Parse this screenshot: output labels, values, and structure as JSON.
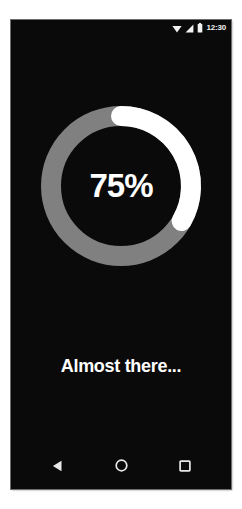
{
  "device": {
    "screen_background": "#0a0a0a"
  },
  "status_bar": {
    "time": "12:30",
    "icons": [
      {
        "name": "wifi-icon",
        "glyph": "wifi"
      },
      {
        "name": "cellular-signal-icon",
        "glyph": "signal"
      },
      {
        "name": "battery-icon",
        "glyph": "battery"
      }
    ],
    "icon_color": "#f2f2f2"
  },
  "progress": {
    "percent_label": "75%",
    "percent_value": 75,
    "arc_sweep_degrees": 120,
    "arc_start_degrees": 0,
    "track_color": "#808080",
    "indicator_color": "#ffffff",
    "stroke_width": 20
  },
  "message": {
    "text": "Almost there...",
    "color": "#ffffff"
  },
  "nav_bar": {
    "buttons": [
      {
        "name": "back-button",
        "icon": "back-triangle-icon"
      },
      {
        "name": "home-button",
        "icon": "home-circle-icon"
      },
      {
        "name": "recents-button",
        "icon": "recents-square-icon"
      }
    ],
    "icon_color": "#e8e8e8"
  }
}
